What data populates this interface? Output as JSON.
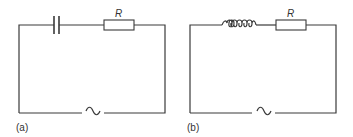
{
  "figure": {
    "colors": {
      "line": "#3a3a3a",
      "text": "#333333",
      "background": "#ffffff"
    },
    "circuits": [
      {
        "id": "a",
        "label": "(a)",
        "components": [
          {
            "type": "capacitor",
            "name": "capacitor"
          },
          {
            "type": "resistor",
            "name": "resistor",
            "label": "R"
          },
          {
            "type": "ac-source",
            "name": "ac-source",
            "symbol": "~"
          }
        ]
      },
      {
        "id": "b",
        "label": "(b)",
        "components": [
          {
            "type": "inductor",
            "name": "inductor"
          },
          {
            "type": "resistor",
            "name": "resistor",
            "label": "R"
          },
          {
            "type": "ac-source",
            "name": "ac-source",
            "symbol": "~"
          }
        ]
      }
    ]
  }
}
